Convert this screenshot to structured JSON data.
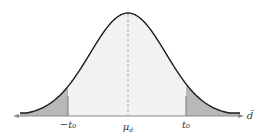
{
  "diagram": {
    "type": "normal-distribution-two-tailed",
    "x_axis_label": "d̄",
    "labels": {
      "left_cutoff": "−t₀",
      "center": "μ",
      "center_sub": "d",
      "right_cutoff": "t₀"
    },
    "colors": {
      "curve": "#1a1a1a",
      "body_fill": "#f2f2f2",
      "tail_fill": "#b8b8b8",
      "axis": "#888888",
      "mean_line": "#999999"
    }
  }
}
